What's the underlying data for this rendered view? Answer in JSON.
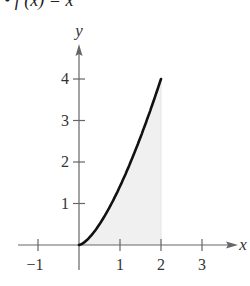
{
  "title": "• f (x) = x",
  "chart_data": {
    "type": "area",
    "xlabel": "x",
    "ylabel": "y",
    "x_ticks": [
      -1,
      1,
      2,
      3
    ],
    "y_ticks": [
      1,
      2,
      3,
      4
    ],
    "x_tick_labels": [
      "−1",
      "1",
      "2",
      "3"
    ],
    "y_tick_labels": [
      "1",
      "2",
      "3",
      "4"
    ],
    "xlim": [
      -1.5,
      3.8
    ],
    "ylim": [
      0,
      4.8
    ],
    "grid": false,
    "curve": {
      "expression": "x^(3/2)",
      "domain": [
        0,
        2
      ],
      "points": [
        [
          0,
          0
        ],
        [
          0.5,
          0.354
        ],
        [
          1,
          1
        ],
        [
          1.5,
          1.837
        ],
        [
          2,
          2.828
        ]
      ]
    },
    "shaded_region": {
      "description": "region under curve from x=0 to x=2",
      "x_from": 0,
      "x_to": 2,
      "color": "#f0f0f0"
    },
    "curve_color": "#111111",
    "axis_color": "#666666"
  }
}
